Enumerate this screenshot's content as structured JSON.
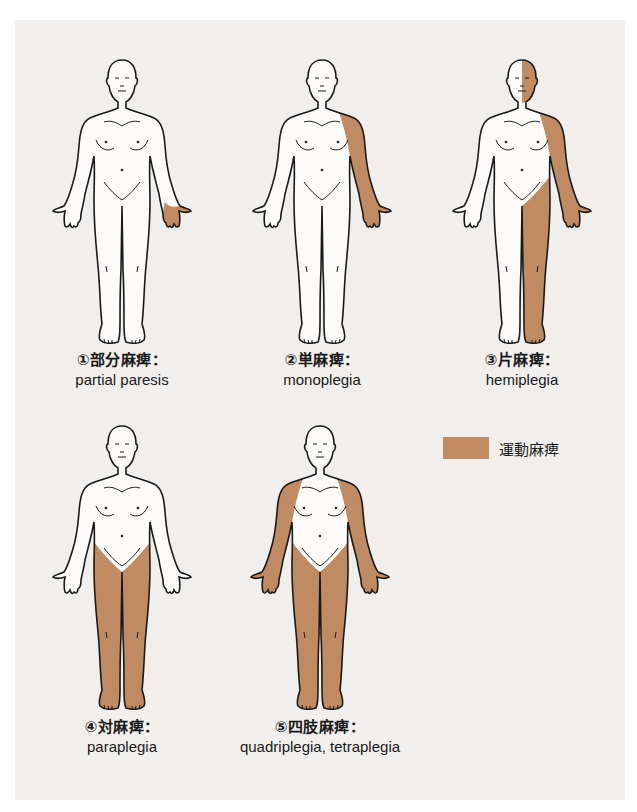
{
  "colors": {
    "background": "#ffffff",
    "panel": "#f0efed",
    "paralysis": "#c08a63",
    "outline": "#1a1a1a",
    "skin": "#fdfcfa"
  },
  "figures": [
    {
      "id": 1,
      "label_jp": "①部分麻痺：",
      "label_en": "partial paresis",
      "shaded": [
        "left-hand"
      ]
    },
    {
      "id": 2,
      "label_jp": "②単麻痺：",
      "label_en": "monoplegia",
      "shaded": [
        "left-arm"
      ]
    },
    {
      "id": 3,
      "label_jp": "③片麻痺：",
      "label_en": "hemiplegia",
      "shaded": [
        "left-face",
        "left-arm",
        "left-leg"
      ]
    },
    {
      "id": 4,
      "label_jp": "④対麻痺：",
      "label_en": "paraplegia",
      "shaded": [
        "left-leg",
        "right-leg"
      ]
    },
    {
      "id": 5,
      "label_jp": "⑤四肢麻痺：",
      "label_en": "quadriplegia, tetraplegia",
      "shaded": [
        "left-arm",
        "right-arm",
        "left-leg",
        "right-leg"
      ]
    }
  ],
  "legend": {
    "label": "運動麻痺",
    "icon": "brown-swatch"
  }
}
